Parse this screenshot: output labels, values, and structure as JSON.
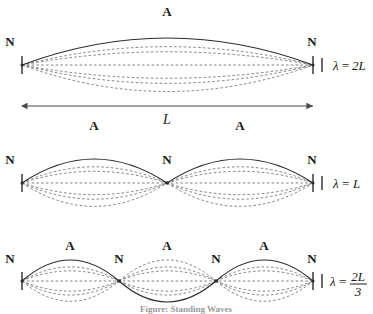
{
  "figure": {
    "caption": "Figure: Standing Waves",
    "background_color": "#ffffff",
    "solid_curve_color": "#2b2b2b",
    "dashed_curve_color": "#6e6e6e"
  },
  "labels": {
    "node": "N",
    "antinode": "A",
    "length": "L",
    "lambda": "λ",
    "equals": "=",
    "two_L": "2L",
    "L": "L",
    "numerator_2L": "2L",
    "denominator_3": "3"
  },
  "geometry": {
    "x_left": 22,
    "x_right": 313,
    "span": 291,
    "baselines": [
      65,
      183,
      281
    ],
    "amplitudes": [
      34,
      30,
      26
    ],
    "dashed_fractions": [
      0.78,
      0.54,
      0.3
    ],
    "dim_arrow_y": 106,
    "tick_half_height": 9
  },
  "harmonics": [
    {
      "index": 1,
      "name": "first-harmonic",
      "loops": 1,
      "node_count": 3,
      "antinode_count": 1,
      "wavelength_display": "λ = 2L",
      "wavelength_kind": "plain",
      "wavelength_value": "2L",
      "node_positions_x": [
        22,
        313
      ],
      "node_labels": [
        "N",
        "N"
      ],
      "antinode_positions_x": [
        167
      ],
      "antinode_labels": [
        "A"
      ]
    },
    {
      "index": 2,
      "name": "second-harmonic",
      "loops": 2,
      "node_count": 3,
      "antinode_count": 2,
      "wavelength_display": "λ = L",
      "wavelength_kind": "plain",
      "wavelength_value": "L",
      "node_positions_x": [
        22,
        167,
        313
      ],
      "node_labels": [
        "N",
        "N",
        "N"
      ],
      "antinode_positions_x": [
        94,
        240
      ],
      "antinode_labels": [
        "A",
        "A"
      ]
    },
    {
      "index": 3,
      "name": "third-harmonic",
      "loops": 3,
      "node_count": 4,
      "antinode_count": 3,
      "wavelength_display": "λ = 2L/3",
      "wavelength_kind": "fraction",
      "wavelength_numerator": "2L",
      "wavelength_denominator": "3",
      "node_positions_x": [
        22,
        119,
        216,
        313
      ],
      "node_labels": [
        "N",
        "N",
        "N",
        "N"
      ],
      "antinode_positions_x": [
        70,
        167,
        264
      ],
      "antinode_labels": [
        "A",
        "A",
        "A"
      ]
    }
  ],
  "dimension": {
    "name": "string-length",
    "label": "L",
    "label_x": 167,
    "label_y": 122,
    "arrow_left_x": 22,
    "arrow_right_x": 313,
    "arrow_y": 106
  }
}
